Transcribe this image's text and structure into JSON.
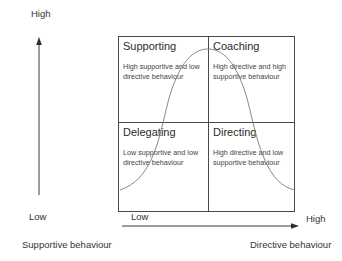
{
  "y_axis": {
    "title": "Supportive behaviour",
    "high_label": "High",
    "low_label": "Low"
  },
  "x_axis": {
    "title": "Directive behaviour",
    "high_label": "High",
    "low_label": "Low"
  },
  "quadrants": {
    "top_left": {
      "title": "Supporting",
      "description": "High supportive and low directive behaviour"
    },
    "top_right": {
      "title": "Coaching",
      "description": "High directive and high supportive behaviour"
    },
    "bottom_left": {
      "title": "Delegating",
      "description": "Low supportive and low directive behaviour"
    },
    "bottom_right": {
      "title": "Directing",
      "description": "High directive and low supportive behaviour"
    }
  },
  "colors": {
    "lines": "#4a4a4a",
    "curve": "#7a7a7a",
    "text": "#2b2b2b"
  }
}
